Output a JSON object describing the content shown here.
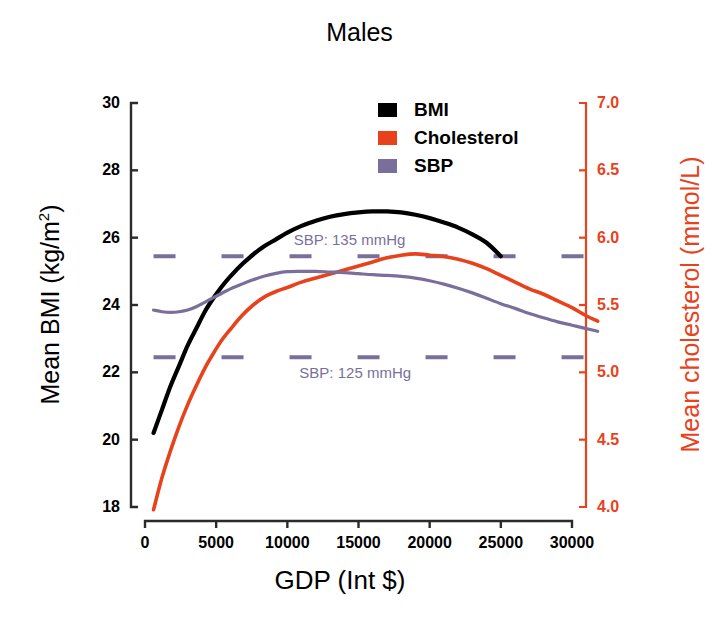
{
  "chart_data": {
    "type": "line",
    "title": "Males",
    "xlabel": "GDP (Int $)",
    "ylabel": "Mean BMI (kg/m",
    "ylabel_sup": "2",
    "ylabel_suffix": ")",
    "ylabel_right": "Mean cholesterol (mmol/L)",
    "xlim": [
      0,
      32000
    ],
    "ylim_left": [
      18,
      30
    ],
    "ylim_right": [
      4.0,
      7.0
    ],
    "grid": false,
    "xticks": [
      0,
      5000,
      10000,
      15000,
      20000,
      25000,
      30000
    ],
    "xticklabels": [
      "0",
      "5000",
      "10000",
      "15000",
      "20000",
      "25000",
      "30000"
    ],
    "yticks_left": [
      18,
      20,
      22,
      24,
      26,
      28,
      30
    ],
    "yticklabels_left": [
      "18",
      "20",
      "22",
      "24",
      "26",
      "28",
      "30"
    ],
    "yticks_right": [
      4.0,
      4.5,
      5.0,
      5.5,
      6.0,
      6.5,
      7.0
    ],
    "yticklabels_right": [
      "4.0",
      "4.5",
      "5.0",
      "5.5",
      "6.0",
      "6.5",
      "7.0"
    ],
    "legend_position": "top-center",
    "series": [
      {
        "name": "BMI",
        "color": "#000000",
        "axis": "left",
        "unit": "kg/m2",
        "x": [
          600,
          1200,
          1800,
          2400,
          3000,
          3600,
          4200,
          4800,
          5400,
          6000,
          6800,
          7600,
          8400,
          9200,
          10000,
          11000,
          12000,
          13000,
          14000,
          15000,
          16000,
          17000,
          18000,
          19000,
          20000,
          21000,
          22000,
          23000,
          24000,
          25000
        ],
        "y": [
          20.2,
          20.9,
          21.6,
          22.2,
          22.8,
          23.3,
          23.8,
          24.2,
          24.55,
          24.85,
          25.2,
          25.5,
          25.75,
          25.95,
          26.15,
          26.35,
          26.5,
          26.62,
          26.7,
          26.75,
          26.78,
          26.78,
          26.75,
          26.68,
          26.58,
          26.45,
          26.3,
          26.1,
          25.85,
          25.45
        ]
      },
      {
        "name": "Cholesterol",
        "color": "#E8421C",
        "axis": "right",
        "unit": "mmol/L",
        "x": [
          600,
          1200,
          1800,
          2400,
          3000,
          3600,
          4200,
          4800,
          5400,
          6000,
          6800,
          7600,
          8400,
          9200,
          10000,
          11000,
          12000,
          13000,
          14000,
          15000,
          16000,
          17000,
          18000,
          19000,
          20000,
          21000,
          22000,
          23000,
          24000,
          25000,
          26000,
          27000,
          28000,
          29000,
          30000,
          31000,
          31800
        ],
        "y": [
          3.98,
          4.22,
          4.42,
          4.6,
          4.76,
          4.9,
          5.03,
          5.14,
          5.24,
          5.32,
          5.42,
          5.5,
          5.56,
          5.6,
          5.63,
          5.67,
          5.7,
          5.73,
          5.76,
          5.79,
          5.82,
          5.85,
          5.87,
          5.88,
          5.87,
          5.86,
          5.84,
          5.81,
          5.77,
          5.72,
          5.67,
          5.62,
          5.58,
          5.53,
          5.48,
          5.42,
          5.38
        ]
      },
      {
        "name": "SBP",
        "color": "#7A6F9B",
        "axis": "left_bmi_scaled",
        "unit": "mmHg",
        "x": [
          600,
          1200,
          1800,
          2400,
          3000,
          3600,
          4200,
          4800,
          5400,
          6000,
          6800,
          7600,
          8400,
          9200,
          10000,
          11000,
          12000,
          13000,
          14000,
          15000,
          16000,
          17000,
          18000,
          19000,
          20000,
          21000,
          22000,
          23000,
          24000,
          25000,
          26000,
          27000,
          28000,
          29000,
          30000,
          31000,
          31800
        ],
        "y_bmi_equiv": [
          23.85,
          23.8,
          23.78,
          23.8,
          23.85,
          23.95,
          24.08,
          24.22,
          24.35,
          24.48,
          24.62,
          24.75,
          24.86,
          24.94,
          24.99,
          25.0,
          25.0,
          24.98,
          24.96,
          24.93,
          24.9,
          24.88,
          24.85,
          24.8,
          24.72,
          24.62,
          24.5,
          24.36,
          24.2,
          24.04,
          23.9,
          23.75,
          23.62,
          23.5,
          23.4,
          23.3,
          23.22
        ]
      }
    ],
    "reference_lines": [
      {
        "label": "SBP: 135 mmHg",
        "bmi_equiv": 25.45,
        "style": "dashed",
        "color": "#7A6F9B"
      },
      {
        "label": "SBP: 125 mmHg",
        "bmi_equiv": 22.45,
        "style": "dashed",
        "color": "#7A6F9B"
      }
    ],
    "annotations": [
      {
        "text": "SBP: 135 mmHg",
        "x": 14800,
        "bmi_equiv": 25.9
      },
      {
        "text": "SBP: 125 mmHg",
        "x": 15200,
        "bmi_equiv": 21.95
      }
    ]
  },
  "legend": {
    "items": [
      {
        "label": "BMI",
        "color": "#000000"
      },
      {
        "label": "Cholesterol",
        "color": "#E8421C"
      },
      {
        "label": "SBP",
        "color": "#7A6F9B"
      }
    ]
  },
  "colors": {
    "bmi": "#000000",
    "cholesterol": "#E8421C",
    "sbp": "#7A6F9B",
    "axis": "#2A2A2A",
    "background": "#FFFFFF"
  }
}
